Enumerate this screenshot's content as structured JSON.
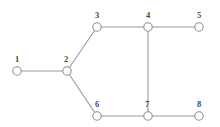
{
  "figure": {
    "background_color": "#ffffff",
    "width": 220,
    "height": 127
  },
  "style": {
    "node_fill": "#ffffff",
    "node_stroke": "#8e8e8e",
    "node_radius": 4.2,
    "edge_color": "#9a9a9a",
    "edge_width": 1.1,
    "label_color": "#4a4a4a",
    "label_font_size": 8.5
  },
  "chart_data": {
    "type": "graph",
    "directed": false,
    "node_count": 8,
    "edge_count": 8,
    "xlabel": "",
    "ylabel": "",
    "grid": false,
    "legend": null,
    "nodes": [
      {
        "id": "1",
        "label": "1",
        "x": 17,
        "y": 71,
        "label_x": 17,
        "label_y": 62
      },
      {
        "id": "2",
        "label": "2",
        "x": 67,
        "y": 71,
        "label_x": 66,
        "label_y": 62
      },
      {
        "id": "3",
        "label": "3",
        "x": 97,
        "y": 27,
        "label_x": 97,
        "label_y": 18
      },
      {
        "id": "4",
        "label": "4",
        "x": 148,
        "y": 27,
        "label_x": 148,
        "label_y": 18
      },
      {
        "id": "5",
        "label": "5",
        "x": 199,
        "y": 27,
        "label_x": 199,
        "label_y": 18
      },
      {
        "id": "6",
        "label": "6",
        "x": 97,
        "y": 116,
        "label_x": 97,
        "label_y": 107
      },
      {
        "id": "7",
        "label": "7",
        "x": 148,
        "y": 116,
        "label_x": 147,
        "label_y": 107
      },
      {
        "id": "8",
        "label": "8",
        "x": 199,
        "y": 116,
        "label_x": 199,
        "label_y": 107
      }
    ],
    "edges": [
      {
        "id": "edge-1-2",
        "source": "1",
        "target": "2",
        "x1": 17,
        "y1": 71,
        "x2": 67,
        "y2": 71
      },
      {
        "id": "edge-2-3",
        "source": "2",
        "target": "3",
        "x1": 67,
        "y1": 71,
        "x2": 97,
        "y2": 27
      },
      {
        "id": "edge-2-6",
        "source": "2",
        "target": "6",
        "x1": 67,
        "y1": 71,
        "x2": 97,
        "y2": 116
      },
      {
        "id": "edge-3-4",
        "source": "3",
        "target": "4",
        "x1": 97,
        "y1": 27,
        "x2": 148,
        "y2": 27
      },
      {
        "id": "edge-4-5",
        "source": "4",
        "target": "5",
        "x1": 148,
        "y1": 27,
        "x2": 199,
        "y2": 27
      },
      {
        "id": "edge-4-7",
        "source": "4",
        "target": "7",
        "x1": 148,
        "y1": 27,
        "x2": 148,
        "y2": 116
      },
      {
        "id": "edge-6-7",
        "source": "6",
        "target": "7",
        "x1": 97,
        "y1": 116,
        "x2": 148,
        "y2": 116
      },
      {
        "id": "edge-7-8",
        "source": "7",
        "target": "8",
        "x1": 148,
        "y1": 116,
        "x2": 199,
        "y2": 116
      }
    ]
  }
}
